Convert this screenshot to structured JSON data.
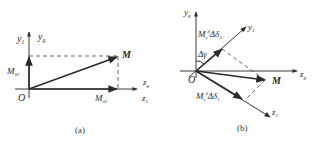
{
  "figure": {
    "panels": [
      {
        "id": "a",
        "caption": "(a)",
        "labels": {
          "origin": "O",
          "y1": "y",
          "y1_sub": "1",
          "yg": "y",
          "yg_sub": "g",
          "zg": "z",
          "zg_sub": "g",
          "z1": "z",
          "z1_sub": "1",
          "point": "M",
          "comp_y": "M",
          "comp_y_sub": "δ3",
          "comp_z": "M",
          "comp_z_sub": "δ1"
        }
      },
      {
        "id": "b",
        "caption": "(b)",
        "labels": {
          "origin": "O",
          "yg": "y",
          "yg_sub": "g",
          "y1": "y",
          "y1_sub": "1",
          "zg": "z",
          "zg_sub": "g",
          "z1": "z",
          "z1_sub": "1",
          "point": "M",
          "angle": "Δγ",
          "comp_y1": "M",
          "comp_y1_sub": "z",
          "comp_y1_sup": "δ",
          "comp_y1_tail": "Δδ",
          "comp_y1_tail_sub": "3",
          "comp_z1": "M",
          "comp_z1_sub": "z",
          "comp_z1_sup": "δ",
          "comp_z1_tail": "Δδ",
          "comp_z1_tail_sub": "1"
        }
      }
    ]
  }
}
